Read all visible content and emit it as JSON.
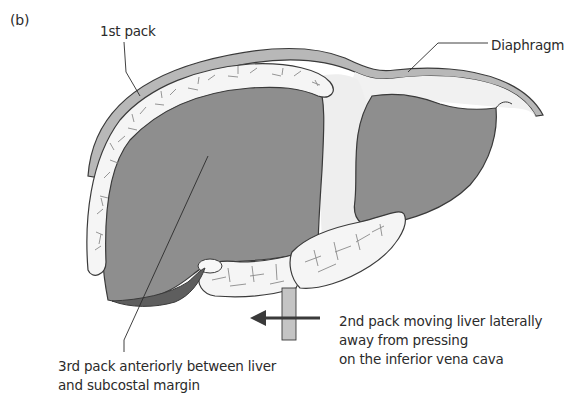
{
  "figure": {
    "panel_label": "(b)",
    "colors": {
      "liver": "#8e8e8e",
      "liver_outline": "#3a3a3a",
      "pack": "#f4f4f4",
      "diaphragm": "#b5b5b5",
      "background": "#ffffff",
      "text": "#2b2b2b"
    },
    "labels": {
      "first_pack": "1st pack",
      "diaphragm": "Diaphragm",
      "second_pack": {
        "line1": "2nd pack moving liver laterally",
        "line2": "away from pressing",
        "line3": "on the inferior vena cava"
      },
      "third_pack": {
        "line1": "3rd pack anteriorly between liver",
        "line2": "and subcostal margin"
      }
    },
    "arrow": {
      "direction": "left",
      "meaning": "lateral movement of liver"
    }
  }
}
